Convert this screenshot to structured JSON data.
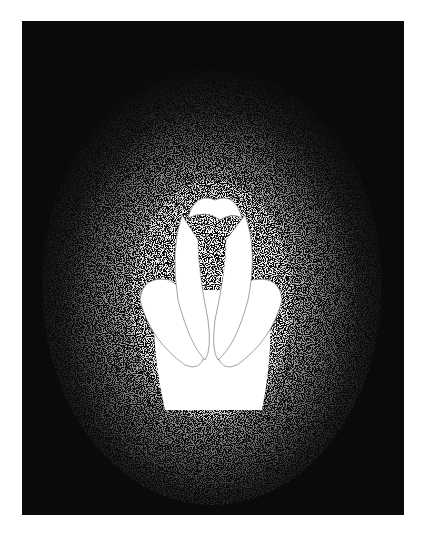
{
  "artwork": {
    "subject": "figure hugging knees with hands over head in a glow of white speckles",
    "colors": {
      "background": "#ffffff",
      "frame": "#0a0a0a",
      "glow": "#ffffff",
      "line": "#7a7a7a"
    },
    "frame": {
      "x": 22,
      "y": 21,
      "width": 382,
      "height": 494
    }
  }
}
